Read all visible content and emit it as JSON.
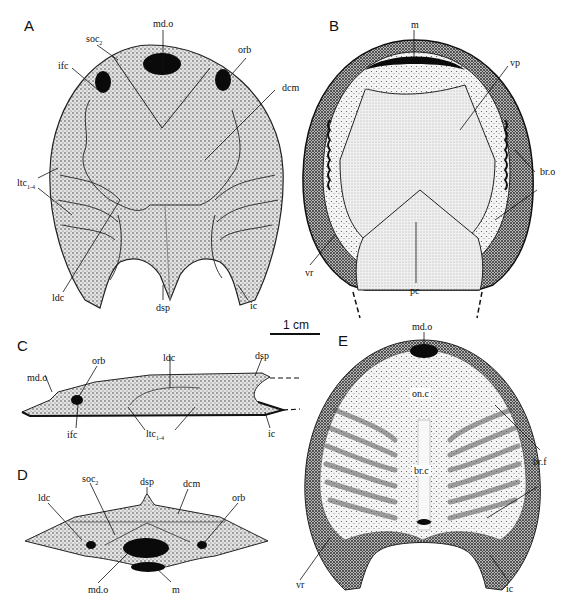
{
  "figure": {
    "scale_bar": {
      "label": "1 cm"
    },
    "panels": [
      {
        "id": "A",
        "letter": "A",
        "view": "dorsal",
        "labels": {
          "mdo": "md.o",
          "soc": "soc",
          "soc_sub": "2",
          "ifc": "ifc",
          "orb": "orb",
          "dcm": "dcm",
          "ltc": "ltc",
          "ltc_sub": "1-4",
          "ldc": "ldc",
          "dsp": "dsp",
          "ic": "ic"
        }
      },
      {
        "id": "B",
        "letter": "B",
        "view": "ventral",
        "labels": {
          "m": "m",
          "vp": "vp",
          "bro": "br.o",
          "vr": "vr",
          "pc": "pc"
        }
      },
      {
        "id": "C",
        "letter": "C",
        "view": "lateral",
        "labels": {
          "mdo": "md.o",
          "orb": "orb",
          "ldc": "ldc",
          "dsp": "dsp",
          "ifc": "ifc",
          "ltc": "ltc",
          "ltc_sub": "1-4",
          "ic": "ic"
        }
      },
      {
        "id": "D",
        "letter": "D",
        "view": "anterior",
        "labels": {
          "dsp": "dsp",
          "soc": "soc",
          "soc_sub": "2",
          "ldc": "ldc",
          "dcm": "dcm",
          "orb": "orb",
          "mdo": "md.o",
          "m": "m"
        }
      },
      {
        "id": "E",
        "letter": "E",
        "view": "internal",
        "labels": {
          "mdo": "md.o",
          "onc": "on.c",
          "brf": "br.f",
          "brc": "br.c",
          "vr": "vr",
          "ic": "ic"
        }
      }
    ]
  }
}
